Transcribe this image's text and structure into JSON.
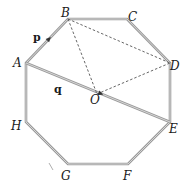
{
  "diagram": {
    "colors": {
      "octagon_edge": "#9a9a9a",
      "dashed": "#555555",
      "arrow": "#333333",
      "label": "#1a1a1a"
    },
    "vertices": [
      {
        "id": "A",
        "label": "A",
        "x": 26,
        "y": 63,
        "lx": 13,
        "ly": 67
      },
      {
        "id": "B",
        "label": "B",
        "x": 68,
        "y": 19,
        "lx": 61,
        "ly": 17
      },
      {
        "id": "C",
        "label": "C",
        "x": 127,
        "y": 19,
        "lx": 128,
        "ly": 21
      },
      {
        "id": "D",
        "label": "D",
        "x": 170,
        "y": 63,
        "lx": 170,
        "ly": 70
      },
      {
        "id": "E",
        "label": "E",
        "x": 170,
        "y": 122,
        "lx": 169,
        "ly": 133
      },
      {
        "id": "F",
        "label": "F",
        "x": 128,
        "y": 164,
        "lx": 123,
        "ly": 180
      },
      {
        "id": "G",
        "label": "G",
        "x": 68,
        "y": 164,
        "lx": 61,
        "ly": 180
      },
      {
        "id": "H",
        "label": "H",
        "x": 26,
        "y": 122,
        "lx": 11,
        "ly": 130
      }
    ],
    "centre": {
      "id": "O",
      "label": "O",
      "x": 97,
      "y": 94,
      "lx": 90,
      "ly": 104
    },
    "vectors": [
      {
        "name": "p",
        "label": "p",
        "from": "A",
        "to": "B",
        "lx": 33,
        "ly": 41
      },
      {
        "name": "q",
        "label": "q",
        "from": "A",
        "to": "E",
        "lx": 54,
        "ly": 93
      }
    ],
    "dashed_segments": [
      {
        "from": "B",
        "to": "D"
      },
      {
        "from": "B",
        "to": "O"
      },
      {
        "from": "O",
        "to": "D"
      }
    ]
  }
}
